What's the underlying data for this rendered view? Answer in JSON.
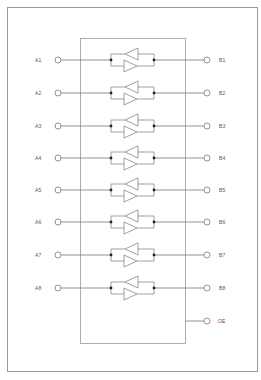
{
  "diagram": {
    "colors": {
      "line": "#7a7a7a",
      "frame": "#9a9a9a",
      "text": "#555555",
      "dot": "#222222",
      "background": "#ffffff"
    },
    "left_pins": [
      {
        "label": "A1",
        "y": 60
      },
      {
        "label": "A2",
        "y": 93
      },
      {
        "label": "A3",
        "y": 126
      },
      {
        "label": "A4",
        "y": 158
      },
      {
        "label": "A5",
        "y": 190
      },
      {
        "label": "A6",
        "y": 222
      },
      {
        "label": "A7",
        "y": 255
      },
      {
        "label": "A8",
        "y": 288
      }
    ],
    "right_pins": [
      {
        "label": "B1",
        "y": 60
      },
      {
        "label": "B2",
        "y": 93
      },
      {
        "label": "B3",
        "y": 126
      },
      {
        "label": "B4",
        "y": 158
      },
      {
        "label": "B5",
        "y": 190
      },
      {
        "label": "B6",
        "y": 222
      },
      {
        "label": "B7",
        "y": 255
      },
      {
        "label": "B8",
        "y": 288
      }
    ],
    "control_pin": {
      "label": "OE",
      "y": 321
    }
  }
}
